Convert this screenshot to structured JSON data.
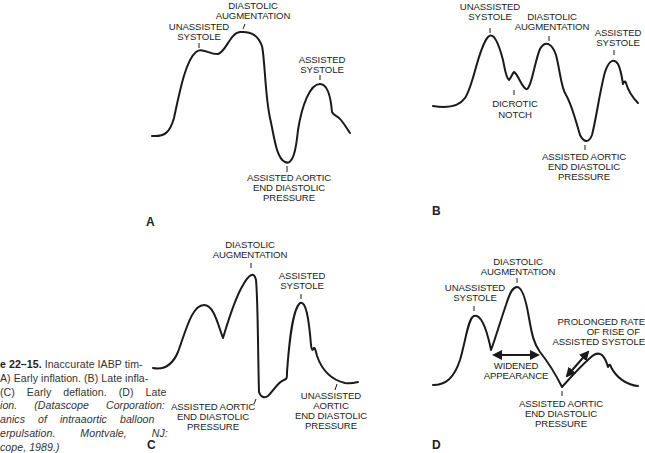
{
  "caption": {
    "figure_number": "e 22–15.",
    "text_main": " Inaccurate IABP timing. (A) Early inflation. (B) Late inflation. (C) Early deflation. (D) Late deflation. ",
    "citation": "(Datascope Corporation: Mechanics of intraaortic balloon counterpulsation. Montvale, NJ: Datascope, 1989.)",
    "visible_lines": [
      "e 22–15. Inaccurate IABP tim-",
      "A) Early inflation. (B) Late infla-",
      "(C) Early deflation. (D) Late",
      "ion. (Datascope Corporation:",
      "anics of intraaortic balloon",
      "erpulsation. Montvale, NJ:",
      "cope, 1989.)"
    ]
  },
  "panels": {
    "A": {
      "letter": "A",
      "title": "Early inflation",
      "labels": {
        "unassisted_systole": [
          "UNASSISTED",
          "SYSTOLE"
        ],
        "diastolic_augmentation": [
          "DIASTOLIC",
          "AUGMENTATION"
        ],
        "assisted_systole": [
          "ASSISTED",
          "SYSTOLE"
        ],
        "assisted_aortic_edp": [
          "ASSISTED AORTIC",
          "END DIASTOLIC",
          "PRESSURE"
        ]
      }
    },
    "B": {
      "letter": "B",
      "title": "Late inflation",
      "labels": {
        "unassisted_systole": [
          "UNASSISTED",
          "SYSTOLE"
        ],
        "diastolic_augmentation": [
          "DIASTOLIC",
          "AUGMENTATION"
        ],
        "assisted_systole": [
          "ASSISTED",
          "SYSTOLE"
        ],
        "dicrotic_notch": [
          "DICROTIC",
          "NOTCH"
        ],
        "assisted_aortic_edp": [
          "ASSISTED AORTIC",
          "END DIASTOLIC",
          "PRESSURE"
        ]
      }
    },
    "C": {
      "letter": "C",
      "title": "Early deflation",
      "labels": {
        "diastolic_augmentation": [
          "DIASTOLIC",
          "AUGMENTATION"
        ],
        "assisted_systole": [
          "ASSISTED",
          "SYSTOLE"
        ],
        "assisted_aortic_edp": [
          "ASSISTED AORTIC",
          "END DIASTOLIC",
          "PRESSURE"
        ],
        "unassisted_aortic_edp": [
          "UNASSISTED",
          "AORTIC",
          "END DIASTOLIC",
          "PRESSURE"
        ]
      }
    },
    "D": {
      "letter": "D",
      "title": "Late deflation",
      "labels": {
        "diastolic_augmentation": [
          "DIASTOLIC",
          "AUGMENTATION"
        ],
        "unassisted_systole": [
          "UNASSISTED",
          "SYSTOLE"
        ],
        "prolonged_rise": [
          "PROLONGED RATE",
          "OF RISE OF",
          "ASSISTED SYSTOLE"
        ],
        "widened_appearance": [
          "WIDENED",
          "APPEARANCE"
        ],
        "assisted_aortic_edp": [
          "ASSISTED AORTIC",
          "END DIASTOLIC",
          "PRESSURE"
        ]
      }
    }
  },
  "colors": {
    "ink": "#1a1a1a",
    "background": "#ffffff",
    "caption_text": "#333333"
  }
}
